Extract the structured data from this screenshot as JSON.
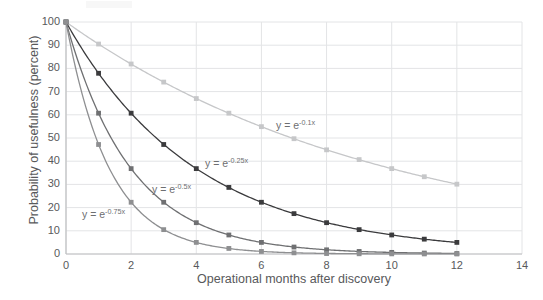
{
  "chart_data": {
    "type": "line",
    "title": "",
    "xlabel": "Operational months after discovery",
    "ylabel": "Probability of usefulness (percent)",
    "xlim": [
      0,
      14
    ],
    "ylim": [
      0,
      100
    ],
    "xticks": [
      0,
      2,
      4,
      6,
      8,
      10,
      12,
      14
    ],
    "yticks": [
      0,
      10,
      20,
      30,
      40,
      50,
      60,
      70,
      80,
      90,
      100
    ],
    "grid": true,
    "legend_position": "inline-annotations",
    "x": [
      0,
      1,
      2,
      3,
      4,
      5,
      6,
      7,
      8,
      9,
      10,
      11,
      12
    ],
    "series": [
      {
        "name": "y = e^-0.1x",
        "label": "y = e",
        "exponent": "-0.1x",
        "rate": 0.1,
        "color": "#c6c7c9",
        "marker": "square",
        "values": [
          100,
          90.5,
          81.9,
          74.1,
          67.0,
          60.7,
          54.9,
          49.7,
          44.9,
          40.7,
          36.8,
          33.3,
          30.1
        ],
        "annotation": {
          "text": "y = e",
          "exponent": "-0.1x",
          "x_px": 276,
          "y_px": 119
        }
      },
      {
        "name": "y = e^-0.25x",
        "label": "y = e",
        "exponent": "-0.25x",
        "rate": 0.25,
        "color": "#3b3b3d",
        "marker": "square",
        "values": [
          100,
          77.9,
          60.7,
          47.2,
          36.8,
          28.7,
          22.3,
          17.4,
          13.5,
          10.5,
          8.2,
          6.4,
          5.0
        ],
        "annotation": {
          "text": "y = e",
          "exponent": "-0.25x",
          "x_px": 205,
          "y_px": 157
        }
      },
      {
        "name": "y = e^-0.5x",
        "label": "y = e",
        "exponent": "-0.5x",
        "rate": 0.5,
        "color": "#6f7072",
        "marker": "square",
        "values": [
          100,
          60.7,
          36.8,
          22.3,
          13.5,
          8.2,
          5.0,
          3.0,
          1.8,
          1.1,
          0.7,
          0.4,
          0.2
        ],
        "annotation": {
          "text": "y = e",
          "exponent": "-0.5x",
          "x_px": 152,
          "y_px": 183
        }
      },
      {
        "name": "y = e^-0.75x",
        "label": "y = e",
        "exponent": "-0.75x",
        "rate": 0.75,
        "color": "#8e8f91",
        "marker": "square",
        "values": [
          100,
          47.2,
          22.3,
          10.5,
          5.0,
          2.4,
          1.1,
          0.5,
          0.2,
          0.1,
          0.06,
          0.03,
          0.01
        ],
        "annotation": {
          "text": "y = e",
          "exponent": "-0.75x",
          "x_px": 82,
          "y_px": 208
        }
      }
    ],
    "colors": {
      "grid": "#e3e4e6",
      "axis": "#bfc0c2",
      "text": "#58595b"
    }
  }
}
